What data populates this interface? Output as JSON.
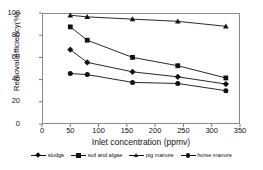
{
  "chart_data": {
    "type": "line",
    "title": "",
    "xlabel": "Inlet concentration (ppmv)",
    "ylabel": "Removal efficiency(%)",
    "x": [
      50,
      80,
      160,
      240,
      325
    ],
    "xlim": [
      0,
      350
    ],
    "ylim": [
      0,
      100
    ],
    "xticks": [
      0,
      50,
      100,
      150,
      200,
      250,
      300,
      350
    ],
    "yticks": [
      0,
      20,
      40,
      60,
      80,
      100
    ],
    "grid": false,
    "legend_position": "bottom",
    "series": [
      {
        "name": "sludge",
        "marker": "diamond",
        "color": "#111111",
        "values": [
          67,
          55.5,
          47,
          42.5,
          36
        ]
      },
      {
        "name": "soil and algae",
        "marker": "square",
        "color": "#111111",
        "values": [
          87.5,
          75.5,
          60,
          52.5,
          41.5
        ]
      },
      {
        "name": "pig manure",
        "marker": "triangle",
        "color": "#111111",
        "values": [
          98,
          96.5,
          94.5,
          92.5,
          88
        ]
      },
      {
        "name": "horse manure",
        "marker": "circle",
        "color": "#111111",
        "values": [
          45.5,
          44.5,
          37.5,
          36.5,
          30
        ]
      }
    ]
  },
  "axis": {
    "y_tick_labels": [
      "0",
      "20",
      "40",
      "60",
      "80",
      "100"
    ],
    "x_tick_labels": [
      "0",
      "50",
      "100",
      "150",
      "200",
      "250",
      "300",
      "350"
    ],
    "x_title": "Inlet concentration (ppmv)",
    "y_title": "Removal efficiency(%)"
  },
  "legend": {
    "items": [
      {
        "label": "sludge",
        "marker": "diamond-marker"
      },
      {
        "label": "soil and algae",
        "marker": "square-marker"
      },
      {
        "label": "pig manure",
        "marker": "triangle-marker"
      },
      {
        "label": "horse manure",
        "marker": "circle-marker"
      }
    ]
  },
  "colors": {
    "line": "#111111",
    "frame": "#8a8a8a",
    "background": "#ffffff"
  }
}
